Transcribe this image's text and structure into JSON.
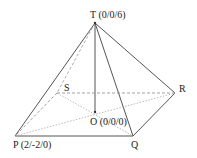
{
  "diagram": {
    "type": "square pyramid",
    "points": {
      "T": {
        "label": "T (0/0/6)",
        "x": 95,
        "y": 23
      },
      "S": {
        "label": "S",
        "x": 57,
        "y": 93
      },
      "R": {
        "label": "R",
        "x": 175,
        "y": 93
      },
      "O": {
        "label": "O (0/0/0)",
        "x": 95,
        "y": 112
      },
      "P": {
        "label": "P (2/-2/0)",
        "x": 15,
        "y": 136
      },
      "Q": {
        "label": "Q",
        "x": 133,
        "y": 136
      }
    },
    "colors": {
      "line": "#555555",
      "dashed": "#888888",
      "dotted": "#aaaaaa"
    }
  }
}
